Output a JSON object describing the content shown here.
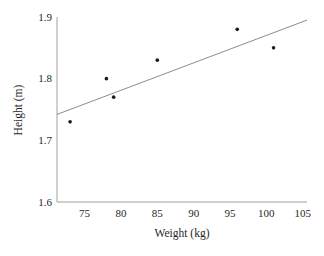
{
  "chart_data": {
    "type": "scatter",
    "title": "",
    "xlabel": "Weight (kg)",
    "ylabel": "Height (m)",
    "xlim": [
      71.2,
      105.6
    ],
    "ylim": [
      1.6,
      1.9
    ],
    "grid": false,
    "legend_position": "none",
    "x_ticks": [
      {
        "value": 75,
        "label": "75"
      },
      {
        "value": 80,
        "label": "80"
      },
      {
        "value": 85,
        "label": "85"
      },
      {
        "value": 90,
        "label": "90"
      },
      {
        "value": 95,
        "label": "95"
      },
      {
        "value": 100,
        "label": "100"
      },
      {
        "value": 105,
        "label": "105"
      }
    ],
    "y_ticks": [
      {
        "value": 1.6,
        "label": "1.6"
      },
      {
        "value": 1.7,
        "label": "1.7"
      },
      {
        "value": 1.8,
        "label": "1.8"
      },
      {
        "value": 1.9,
        "label": "1.9"
      }
    ],
    "points": [
      {
        "x": 73,
        "y": 1.73
      },
      {
        "x": 78,
        "y": 1.8
      },
      {
        "x": 79,
        "y": 1.77
      },
      {
        "x": 85,
        "y": 1.83
      },
      {
        "x": 96,
        "y": 1.88
      },
      {
        "x": 101,
        "y": 1.85
      }
    ],
    "trendline": {
      "x_start": 71.2,
      "y_start": 1.742,
      "x_end": 105.6,
      "y_end": 1.895
    },
    "colors": {
      "point": "#1a1a1a",
      "trendline": "#8c8c8c",
      "axis": "#a0a0a0",
      "text": "#1f1f1f",
      "background": "#ffffff"
    }
  }
}
